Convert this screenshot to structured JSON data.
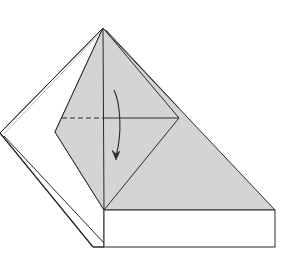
{
  "diagram": {
    "title": "Origami fold step: valley fold top flap down along horizontal line",
    "colors": {
      "background": "#ffffff",
      "paper_colored": "#d4d4d4",
      "paper_white": "#ffffff",
      "line": "#2a2a2a"
    },
    "elements": {
      "apex": [
        103,
        28
      ],
      "left_point": [
        0,
        133
      ],
      "diamond_left": [
        55,
        132
      ],
      "diamond_right": [
        179,
        118
      ],
      "vertical_bottom": [
        104,
        210
      ],
      "triangle_right": [
        275,
        210
      ],
      "box_bottom_left": [
        104,
        247
      ],
      "box_bottom_right": [
        275,
        247
      ],
      "flap_bottom": [
        93,
        247
      ],
      "fold_line_y": 118
    },
    "annotations": {
      "valley_fold_line": "dashed horizontal line (left half)",
      "fold_arrow": "curved arrow pointing down"
    }
  }
}
